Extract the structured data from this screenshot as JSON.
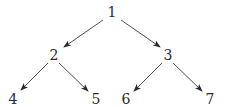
{
  "diagram": {
    "type": "binary-tree",
    "directed": true,
    "nodes": [
      {
        "id": "1",
        "label": "1",
        "x": 112,
        "y": 17
      },
      {
        "id": "2",
        "label": "2",
        "x": 54,
        "y": 60
      },
      {
        "id": "3",
        "label": "3",
        "x": 168,
        "y": 60
      },
      {
        "id": "4",
        "label": "4",
        "x": 13,
        "y": 104
      },
      {
        "id": "5",
        "label": "5",
        "x": 96,
        "y": 104
      },
      {
        "id": "6",
        "label": "6",
        "x": 126,
        "y": 104
      },
      {
        "id": "7",
        "label": "7",
        "x": 210,
        "y": 104
      }
    ],
    "edges": [
      {
        "from": "1",
        "to": "2",
        "x1": 103,
        "y1": 20,
        "x2": 64,
        "y2": 47
      },
      {
        "from": "1",
        "to": "3",
        "x1": 121,
        "y1": 20,
        "x2": 160,
        "y2": 47
      },
      {
        "from": "2",
        "to": "4",
        "x1": 48,
        "y1": 63,
        "x2": 21,
        "y2": 90
      },
      {
        "from": "2",
        "to": "5",
        "x1": 59,
        "y1": 63,
        "x2": 88,
        "y2": 91
      },
      {
        "from": "3",
        "to": "6",
        "x1": 162,
        "y1": 63,
        "x2": 134,
        "y2": 91
      },
      {
        "from": "3",
        "to": "7",
        "x1": 173,
        "y1": 63,
        "x2": 202,
        "y2": 91
      }
    ]
  }
}
